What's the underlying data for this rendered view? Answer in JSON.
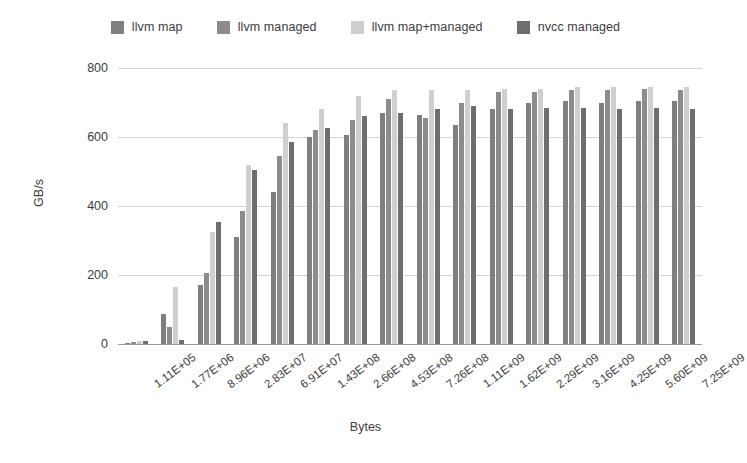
{
  "chart_data": {
    "type": "bar",
    "title": "",
    "xlabel": "Bytes",
    "ylabel": "GB/s",
    "ylim": [
      0,
      800
    ],
    "yticks": [
      0,
      200,
      400,
      600,
      800
    ],
    "grid": true,
    "legend_position": "top-center",
    "categories": [
      "1.11E+05",
      "1.77E+06",
      "8.96E+06",
      "2.83E+07",
      "6.91E+07",
      "1.43E+08",
      "2.66E+08",
      "4.53E+08",
      "7.26E+08",
      "1.11E+09",
      "1.62E+09",
      "2.29E+09",
      "3.16E+09",
      "4.25E+09",
      "5.60E+09",
      "7.25E+09"
    ],
    "series": [
      {
        "name": "llvm map",
        "color": "#7f7f7f",
        "values": [
          4,
          88,
          170,
          310,
          440,
          600,
          605,
          670,
          665,
          635,
          680,
          700,
          705,
          700,
          705,
          705
        ]
      },
      {
        "name": "llvm managed",
        "color": "#8c8c8c",
        "values": [
          6,
          50,
          205,
          385,
          545,
          620,
          650,
          710,
          655,
          700,
          730,
          730,
          735,
          735,
          740,
          735
        ]
      },
      {
        "name": "llvm map+managed",
        "color": "#cfcfcf",
        "values": [
          8,
          165,
          325,
          520,
          640,
          680,
          720,
          735,
          735,
          735,
          740,
          740,
          745,
          745,
          745,
          745
        ]
      },
      {
        "name": "nvcc managed",
        "color": "#6e6e6e",
        "values": [
          10,
          12,
          355,
          505,
          585,
          625,
          660,
          670,
          680,
          690,
          680,
          685,
          685,
          680,
          685,
          680
        ]
      }
    ]
  },
  "legend": {
    "items": [
      {
        "label": "llvm map",
        "color": "#7f7f7f"
      },
      {
        "label": "llvm managed",
        "color": "#8c8c8c"
      },
      {
        "label": "llvm map+managed",
        "color": "#cfcfcf"
      },
      {
        "label": "nvcc managed",
        "color": "#6e6e6e"
      }
    ]
  },
  "axes": {
    "y_title": "GB/s",
    "x_title": "Bytes",
    "y_tick_labels": [
      "800",
      "600",
      "400",
      "200",
      "0"
    ],
    "x_tick_labels": [
      "1.11E+05",
      "1.77E+06",
      "8.96E+06",
      "2.83E+07",
      "6.91E+07",
      "1.43E+08",
      "2.66E+08",
      "4.53E+08",
      "7.26E+08",
      "1.11E+09",
      "1.62E+09",
      "2.29E+09",
      "3.16E+09",
      "4.25E+09",
      "5.60E+09",
      "7.25E+09"
    ]
  },
  "colors": {
    "gridline": "#d4d4d4",
    "axis": "#9a9a9a",
    "text": "#3c3c3c",
    "background": "#ffffff"
  }
}
